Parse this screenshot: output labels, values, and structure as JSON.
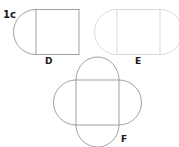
{
  "figure_label": "1c",
  "shapes": [
    {
      "label": "D",
      "description": "square with one semicircle on left side"
    },
    {
      "label": "E",
      "description": "square with semicircles on left and right sides"
    },
    {
      "label": "F",
      "description": "square with semicircles on all four sides"
    }
  ],
  "colors": {
    "stroke_dark": "#8a8a8a",
    "stroke_light": "#cfcfcf",
    "text": "#1a1a1a"
  }
}
